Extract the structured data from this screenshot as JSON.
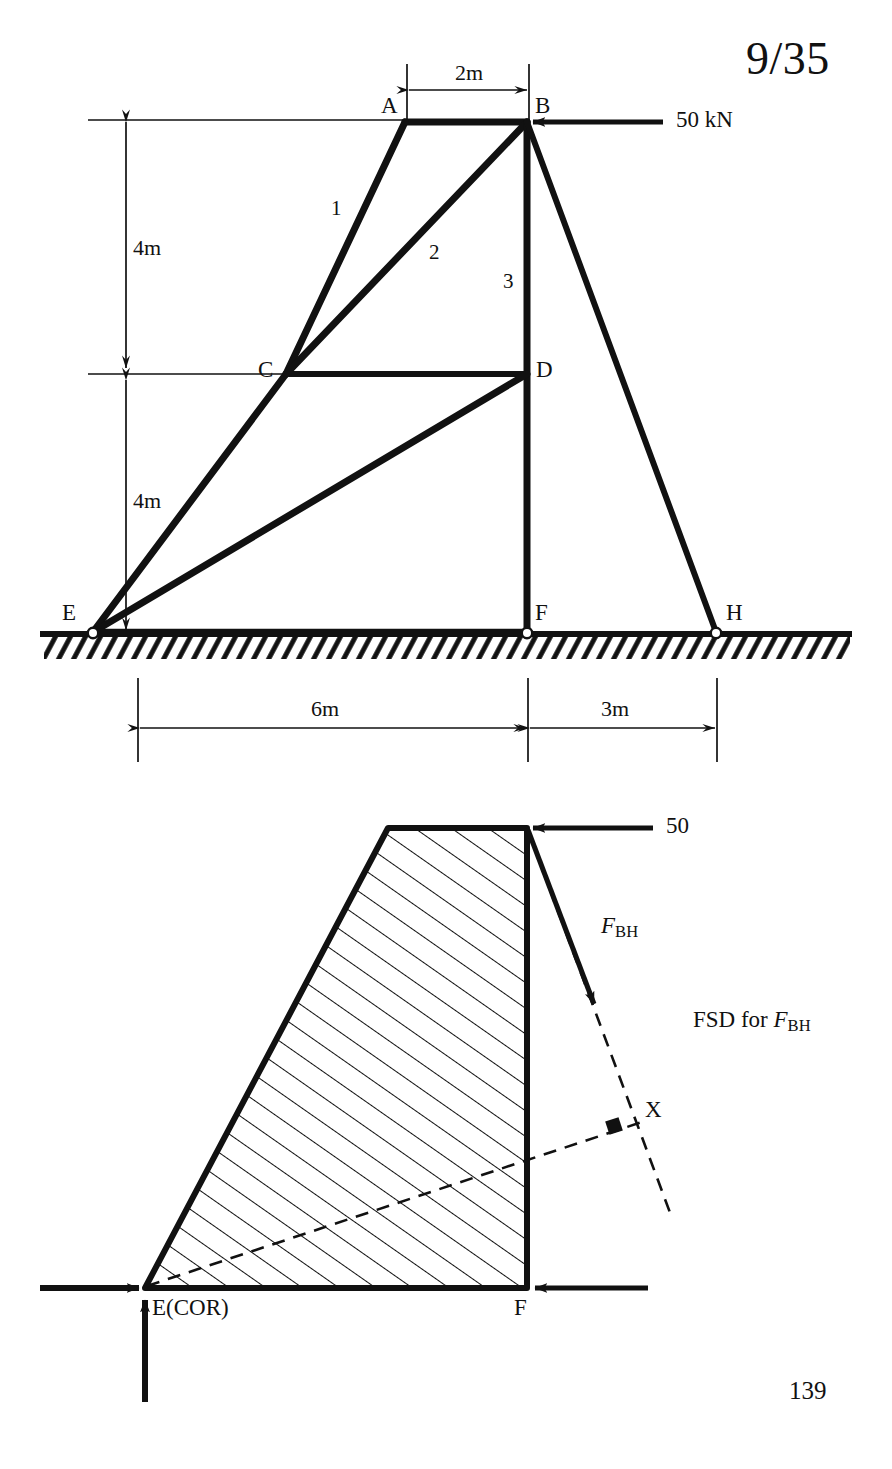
{
  "document": {
    "problem_number": "9/35",
    "page_number": "139"
  },
  "truss": {
    "joint_labels": {
      "A": "A",
      "B": "B",
      "C": "C",
      "D": "D",
      "E": "E",
      "F": "F",
      "H": "H"
    },
    "member_numbers": {
      "one": "1",
      "two": "2",
      "three": "3"
    },
    "dimensions": {
      "top_span": "2m",
      "upper_height": "4m",
      "lower_height": "4m",
      "bottom_left_span": "6m",
      "bottom_right_span": "3m"
    },
    "applied_load": {
      "label": "50 kN",
      "magnitude": 50,
      "unit": "kN",
      "direction": "leftward",
      "applied_at": "B"
    }
  },
  "free_body_diagram": {
    "caption_prefix": "FSD for ",
    "caption_symbol": "F",
    "caption_subscript": "BH",
    "applied_load_label": "50",
    "force_symbol": "F",
    "force_subscript": "BH",
    "point_x_label": "X",
    "joint_e_label": "E(COR)",
    "joint_f_label": "F"
  },
  "geometry": {
    "truss_points": {
      "A": [
        405,
        122
      ],
      "B": [
        527,
        122
      ],
      "C": [
        286,
        374
      ],
      "D": [
        527,
        374
      ],
      "E": [
        93,
        632
      ],
      "F": [
        527,
        632
      ],
      "H": [
        716,
        632
      ]
    },
    "fbd_points": {
      "top_left": [
        388,
        828
      ],
      "top_right": [
        527,
        828
      ],
      "bottom_right": [
        527,
        1288
      ],
      "bottom_left": [
        145,
        1288
      ],
      "X": [
        626,
        1130
      ]
    }
  },
  "colors": {
    "ink": "#111111",
    "paper": "#ffffff"
  }
}
